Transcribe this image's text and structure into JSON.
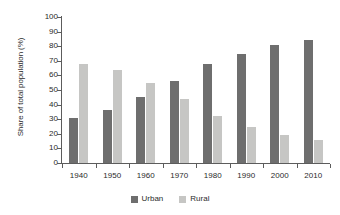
{
  "chart_data": {
    "type": "bar",
    "title": "",
    "subtitle": "",
    "xlabel": "",
    "ylabel": "Share of total population (%)",
    "ylim": [
      0,
      100
    ],
    "ytick_step": 10,
    "yticks": [
      "100",
      "90",
      "80",
      "70",
      "60",
      "50",
      "40",
      "30",
      "20",
      "10",
      "0"
    ],
    "grid": false,
    "legend_position": "bottom-center",
    "categories": [
      "1940",
      "1950",
      "1960",
      "1970",
      "1980",
      "1990",
      "2000",
      "2010"
    ],
    "series": [
      {
        "name": "Urban",
        "color": "#6e6e6e",
        "values": [
          31,
          36,
          45,
          56,
          68,
          75,
          81,
          84
        ]
      },
      {
        "name": "Rural",
        "color": "#c6c6c4",
        "values": [
          68,
          64,
          55,
          44,
          32,
          25,
          19,
          16
        ]
      }
    ]
  },
  "axis": {
    "line_color": "#5c5c5c"
  },
  "legend": {
    "entries": [
      {
        "label": "Urban",
        "color": "#6e6e6e"
      },
      {
        "label": "Rural",
        "color": "#c6c6c4"
      }
    ]
  }
}
